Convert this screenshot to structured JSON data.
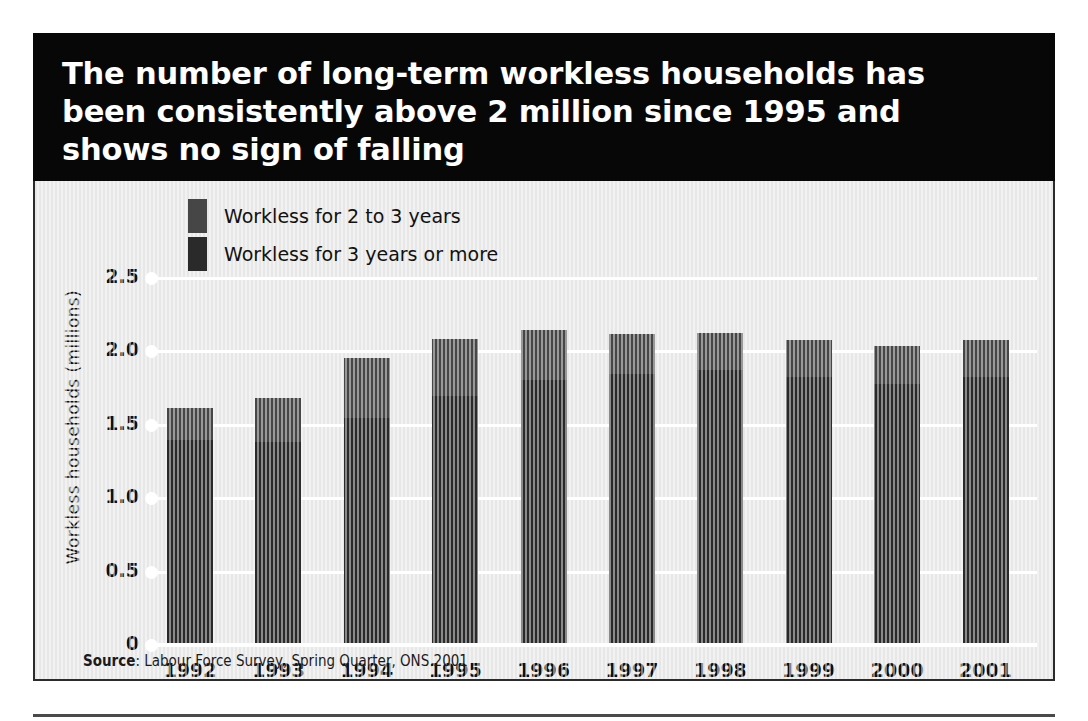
{
  "title": "The number of long-term workless households has been consistently above 2 million since 1995 and shows no sign of falling",
  "source": {
    "label": "Source",
    "text": ": Labour Force Survey, Spring Quarter, ONS 2001"
  },
  "legend": {
    "position": "top-left-inside",
    "items": [
      {
        "label": "Workless for 2 to 3 years",
        "color": "#464646"
      },
      {
        "label": "Workless for 3 years or more",
        "color": "#2a2a2a"
      }
    ]
  },
  "colors": {
    "banner_background": "#070707",
    "banner_text": "#ffffff",
    "plot_background": "#e7e7e7",
    "gridline": "#ffffff",
    "series_2_to_3_years": "#464646",
    "series_3_years_or_more": "#2a2a2a",
    "axis_text": "#111111",
    "panel_border": "#2b2b2b"
  },
  "chart_data": {
    "type": "bar",
    "subtype": "stacked-vertical",
    "title": "The number of long-term workless households has been consistently above 2 million since 1995 and shows no sign of falling",
    "xlabel": "",
    "ylabel": "Workless households (millions)",
    "categories": [
      "1992",
      "1993",
      "1994",
      "1995",
      "1996",
      "1997",
      "1998",
      "1999",
      "2000",
      "2001"
    ],
    "series": [
      {
        "name": "Workless for 3 years or more",
        "color": "#2a2a2a",
        "values": [
          1.38,
          1.37,
          1.53,
          1.68,
          1.79,
          1.83,
          1.86,
          1.81,
          1.76,
          1.81
        ]
      },
      {
        "name": "Workless for 2 to 3 years",
        "color": "#464646",
        "values": [
          0.22,
          0.3,
          0.41,
          0.39,
          0.34,
          0.27,
          0.25,
          0.25,
          0.26,
          0.25
        ]
      }
    ],
    "totals": [
      1.6,
      1.67,
      1.94,
      2.07,
      2.13,
      2.1,
      2.11,
      2.06,
      2.02,
      2.06
    ],
    "ylim": [
      0,
      2.5
    ],
    "yticks": [
      0,
      0.5,
      1.0,
      1.5,
      2.0,
      2.5
    ],
    "ytick_labels": [
      "0",
      "0.5",
      "1.0",
      "1.5",
      "2.0",
      "2.5"
    ],
    "grid": "horizontal-white",
    "legend_position": "inside-top-left"
  }
}
